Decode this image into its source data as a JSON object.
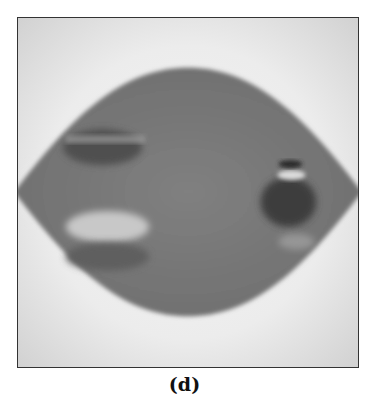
{
  "figure": {
    "panel_label": "(d)",
    "colors": {
      "background": "#e4e4e4",
      "background_glow": "#f2f2f2",
      "lens_fill": "#7a7a7a",
      "dark_feature": "#4a4a4a",
      "light_feature": "#cfcfcf",
      "frame": "#333333"
    }
  }
}
